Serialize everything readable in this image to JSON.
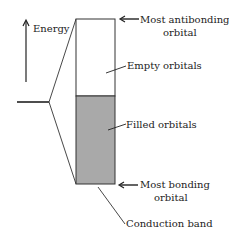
{
  "diagram": {
    "axis_label": "Energy",
    "labels": {
      "most_antibonding": [
        "Most antibonding",
        "orbital"
      ],
      "empty": "Empty orbitals",
      "filled": "Filled orbitals",
      "most_bonding": [
        "Most bonding",
        "orbital"
      ],
      "conduction_band": "Conduction band"
    },
    "colors": {
      "filled_fill": "#a9a9a9",
      "empty_fill": "#ffffff",
      "line": "#333333"
    }
  }
}
